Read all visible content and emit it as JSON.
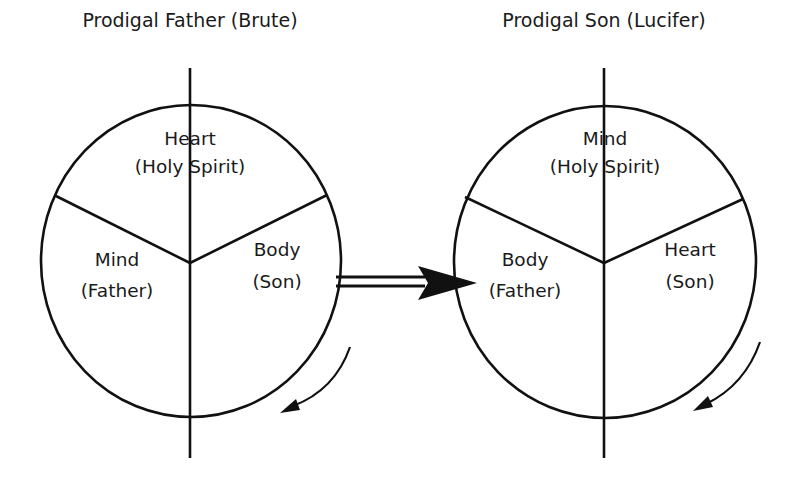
{
  "diagrams": [
    {
      "title": "Prodigal Father (Brute)",
      "segments": {
        "top": {
          "name": "Heart",
          "role": "(Holy Spirit)"
        },
        "left": {
          "name": "Mind",
          "role": "(Father)"
        },
        "right": {
          "name": "Body",
          "role": "(Son)"
        }
      },
      "rotation": "counterclockwise-arrow"
    },
    {
      "title": "Prodigal Son (Lucifer)",
      "segments": {
        "top": {
          "name": "Mind",
          "role": "(Holy Spirit)"
        },
        "left": {
          "name": "Body",
          "role": "(Father)"
        },
        "right": {
          "name": "Heart",
          "role": "(Son)"
        }
      },
      "rotation": "counterclockwise-arrow"
    }
  ],
  "transition": {
    "icon": "double-arrow-right-icon"
  },
  "colors": {
    "ink": "#111111",
    "background": "#ffffff"
  }
}
